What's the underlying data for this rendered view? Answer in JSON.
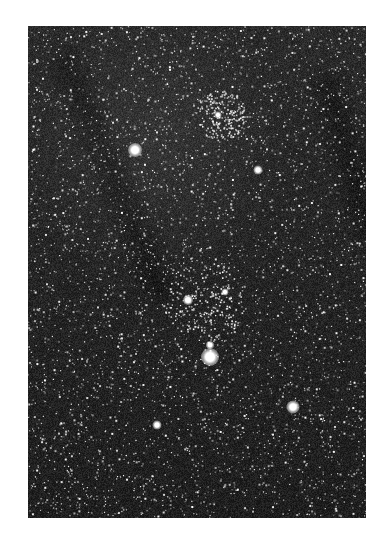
{
  "image": {
    "subject": "star field photograph (grayscale night sky)",
    "frame": {
      "left": 28,
      "top": 26,
      "width": 338,
      "height": 492
    },
    "colors": {
      "page_background": "#ffffff",
      "sky_background": "#1a1a1a",
      "star": "#ffffff"
    },
    "bright_stars": [
      {
        "x": 135,
        "y": 150,
        "size": 14
      },
      {
        "x": 258,
        "y": 170,
        "size": 9
      },
      {
        "x": 188,
        "y": 300,
        "size": 10
      },
      {
        "x": 210,
        "y": 357,
        "size": 18
      },
      {
        "x": 210,
        "y": 345,
        "size": 8
      },
      {
        "x": 293,
        "y": 407,
        "size": 13
      },
      {
        "x": 157,
        "y": 425,
        "size": 9
      },
      {
        "x": 218,
        "y": 115,
        "size": 7
      },
      {
        "x": 225,
        "y": 292,
        "size": 7
      }
    ],
    "cluster_regions": [
      {
        "x": 205,
        "y": 300,
        "r": 40
      },
      {
        "x": 220,
        "y": 115,
        "r": 25
      }
    ],
    "faint_star_count": 4200,
    "dark_lanes": [
      {
        "x1": 40,
        "y1": 40,
        "x2": 130,
        "y2": 260
      },
      {
        "x1": 300,
        "y1": 60,
        "x2": 340,
        "y2": 200
      }
    ]
  }
}
